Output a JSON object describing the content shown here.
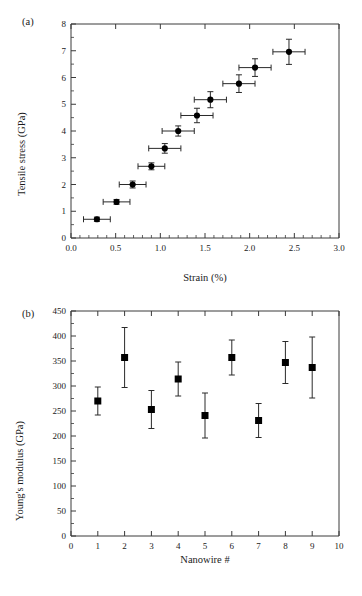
{
  "figure": {
    "background": "#ffffff",
    "ink_color": "#1a1a1a",
    "marker_color": "#000000"
  },
  "panels": {
    "a": {
      "label": "(a)",
      "xlabel": "Strain (%)",
      "ylabel": "Tensile stress (GPa)"
    },
    "b": {
      "label": "(b)",
      "xlabel": "Nanowire #",
      "ylabel": "Young's modulus (GPa)"
    }
  },
  "chart_data": [
    {
      "type": "scatter",
      "panel": "a",
      "title": "",
      "xlabel": "Strain (%)",
      "ylabel": "Tensile stress (GPa)",
      "xlim": [
        0.0,
        3.0
      ],
      "ylim": [
        0,
        8
      ],
      "xticks": [
        0.0,
        0.5,
        1.0,
        1.5,
        2.0,
        2.5,
        3.0
      ],
      "xtick_labels": [
        "0.0",
        "0.5",
        "1.0",
        "1.5",
        "2.0",
        "2.5",
        "3.0"
      ],
      "yticks": [
        0,
        1,
        2,
        3,
        4,
        5,
        6,
        7,
        8
      ],
      "ytick_labels": [
        "0",
        "1",
        "2",
        "3",
        "4",
        "5",
        "6",
        "7",
        "8"
      ],
      "x_minor_ticks_per_interval": 4,
      "y_minor_ticks_per_interval": 1,
      "grid": false,
      "legend": null,
      "marker": "filled-circle",
      "error_bars": "both",
      "points": [
        {
          "x": 0.29,
          "y": 0.7,
          "xerr": 0.15,
          "yerr": 0.08
        },
        {
          "x": 0.51,
          "y": 1.35,
          "xerr": 0.15,
          "yerr": 0.09
        },
        {
          "x": 0.69,
          "y": 2.0,
          "xerr": 0.15,
          "yerr": 0.13
        },
        {
          "x": 0.9,
          "y": 2.68,
          "xerr": 0.15,
          "yerr": 0.13
        },
        {
          "x": 1.05,
          "y": 3.35,
          "xerr": 0.18,
          "yerr": 0.18
        },
        {
          "x": 1.2,
          "y": 4.0,
          "xerr": 0.18,
          "yerr": 0.19
        },
        {
          "x": 1.41,
          "y": 4.58,
          "xerr": 0.18,
          "yerr": 0.27
        },
        {
          "x": 1.56,
          "y": 5.17,
          "xerr": 0.18,
          "yerr": 0.3
        },
        {
          "x": 1.88,
          "y": 5.77,
          "xerr": 0.18,
          "yerr": 0.33
        },
        {
          "x": 2.06,
          "y": 6.37,
          "xerr": 0.18,
          "yerr": 0.33
        },
        {
          "x": 2.44,
          "y": 6.96,
          "xerr": 0.18,
          "yerr": 0.47
        }
      ]
    },
    {
      "type": "scatter",
      "panel": "b",
      "title": "",
      "xlabel": "Nanowire #",
      "ylabel": "Young's modulus (GPa)",
      "xlim": [
        0,
        10
      ],
      "ylim": [
        0,
        450
      ],
      "xticks": [
        0,
        1,
        2,
        3,
        4,
        5,
        6,
        7,
        8,
        9,
        10
      ],
      "xtick_labels": [
        "0",
        "1",
        "2",
        "3",
        "4",
        "5",
        "6",
        "7",
        "8",
        "9",
        "10"
      ],
      "yticks": [
        0,
        50,
        100,
        150,
        200,
        250,
        300,
        350,
        400,
        450
      ],
      "ytick_labels": [
        "0",
        "50",
        "100",
        "150",
        "200",
        "250",
        "300",
        "350",
        "400",
        "450"
      ],
      "x_minor_ticks_per_interval": 0,
      "y_minor_ticks_per_interval": 1,
      "grid": false,
      "legend": null,
      "marker": "filled-square",
      "error_bars": "y",
      "categories": [
        1,
        2,
        3,
        4,
        5,
        6,
        7,
        8,
        9
      ],
      "values": [
        270,
        357,
        253,
        314,
        241,
        357,
        231,
        347,
        337
      ],
      "errors": [
        28,
        60,
        38,
        34,
        45,
        35,
        34,
        42,
        61
      ],
      "points": [
        {
          "x": 1,
          "y": 270,
          "yerr": 28
        },
        {
          "x": 2,
          "y": 357,
          "yerr": 60
        },
        {
          "x": 3,
          "y": 253,
          "yerr": 38
        },
        {
          "x": 4,
          "y": 314,
          "yerr": 34
        },
        {
          "x": 5,
          "y": 241,
          "yerr": 45
        },
        {
          "x": 6,
          "y": 357,
          "yerr": 35
        },
        {
          "x": 7,
          "y": 231,
          "yerr": 34
        },
        {
          "x": 8,
          "y": 347,
          "yerr": 42
        },
        {
          "x": 9,
          "y": 337,
          "yerr": 61
        }
      ]
    }
  ]
}
